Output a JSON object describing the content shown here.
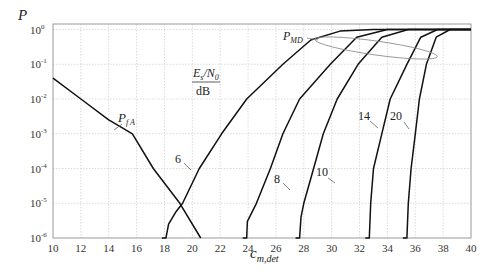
{
  "chart_data": {
    "type": "line",
    "title": "",
    "xlabel": "c_{m,det}",
    "ylabel": "P",
    "xlim": [
      10,
      40
    ],
    "ylim": [
      1e-06,
      1
    ],
    "yscale": "log",
    "grid": true,
    "x_ticks": [
      "10",
      "12",
      "14",
      "16",
      "18",
      "20",
      "22",
      "24",
      "26",
      "28",
      "30",
      "32",
      "34",
      "36",
      "38",
      "40"
    ],
    "y_ticks": [
      "10^0",
      "10^-1",
      "10^-2",
      "10^-3",
      "10^-4",
      "10^-5",
      "10^-6"
    ],
    "legend_title": "E_s/N_0 / dB",
    "annotations": [
      "P_FA",
      "P_MD",
      "E_s/N_0 / dB",
      "6",
      "8",
      "10",
      "14",
      "20"
    ],
    "series": [
      {
        "name": "P_FA",
        "points": [
          [
            10,
            0.04
          ],
          [
            12,
            0.01
          ],
          [
            14,
            0.0025
          ],
          [
            15.7,
            0.001
          ],
          [
            17.2,
            0.0001
          ],
          [
            19.1,
            1e-05
          ],
          [
            20.6,
            1e-06
          ]
        ]
      },
      {
        "name": "P_MD 6 dB",
        "points": [
          [
            18.1,
            1e-06
          ],
          [
            18.3,
            2.5e-06
          ],
          [
            18.8,
            5.5e-06
          ],
          [
            19.3,
            1e-05
          ],
          [
            20.5,
            0.0001
          ],
          [
            22.1,
            0.001
          ],
          [
            23.9,
            0.01
          ],
          [
            26.5,
            0.1
          ],
          [
            28.5,
            0.5
          ],
          [
            30.6,
            0.9
          ],
          [
            33,
            1
          ]
        ]
      },
      {
        "name": "P_MD 8 dB",
        "points": [
          [
            23.9,
            1e-06
          ],
          [
            23.95,
            3e-06
          ],
          [
            24.6,
            1e-05
          ],
          [
            25.6,
            0.0001
          ],
          [
            26.5,
            0.001
          ],
          [
            27.7,
            0.01
          ],
          [
            29.9,
            0.1
          ],
          [
            31.8,
            0.6
          ],
          [
            34,
            1
          ]
        ]
      },
      {
        "name": "P_MD 10 dB",
        "points": [
          [
            27.7,
            1e-06
          ],
          [
            27.8,
            4e-06
          ],
          [
            28.0,
            1e-05
          ],
          [
            28.7,
            0.0001
          ],
          [
            29.4,
            0.001
          ],
          [
            30.4,
            0.01
          ],
          [
            31.9,
            0.1
          ],
          [
            33.6,
            0.6
          ],
          [
            35.5,
            1
          ]
        ]
      },
      {
        "name": "P_MD 14 dB",
        "points": [
          [
            32.7,
            1e-06
          ],
          [
            32.8,
            1e-05
          ],
          [
            33.0,
            0.0001
          ],
          [
            33.6,
            0.001
          ],
          [
            34.2,
            0.01
          ],
          [
            35.4,
            0.1
          ],
          [
            36.4,
            0.6
          ],
          [
            37.6,
            1
          ]
        ]
      },
      {
        "name": "P_MD 20 dB",
        "points": [
          [
            35.4,
            1e-06
          ],
          [
            35.5,
            1e-05
          ],
          [
            35.7,
            0.0001
          ],
          [
            36.0,
            0.001
          ],
          [
            36.3,
            0.01
          ],
          [
            36.8,
            0.1
          ],
          [
            37.5,
            0.6
          ],
          [
            38.5,
            1
          ]
        ]
      }
    ]
  },
  "labels": {
    "y_axis": "P",
    "x_axis_main": "c",
    "x_axis_sub": "m,det",
    "pfa_main": "P",
    "pfa_sub": "f A",
    "pmd_main": "P",
    "pmd_sub": "MD",
    "legend_num": "E",
    "legend_num_sub": "s",
    "legend_num_rest": "/N",
    "legend_num_sub2": "0",
    "legend_den": "dB",
    "curve_6": "6",
    "curve_8": "8",
    "curve_10": "10",
    "curve_14": "14",
    "curve_20": "20"
  }
}
